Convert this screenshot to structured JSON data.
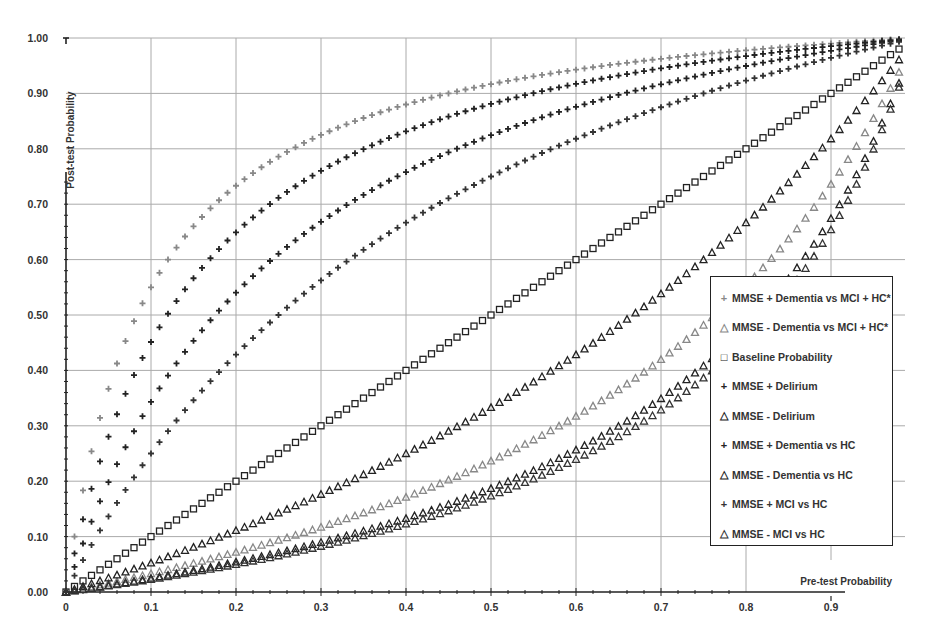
{
  "chart_data": {
    "type": "scatter",
    "title": "",
    "xlabel": "Pre-test Probability",
    "ylabel": "Post-test Probability",
    "xlim": [
      0,
      1.0
    ],
    "ylim": [
      0,
      1.0
    ],
    "x_ticks": [
      "0",
      "0.1",
      "0.2",
      "0.3",
      "0.4",
      "0.5",
      "0.6",
      "0.7",
      "0.8",
      "0.9"
    ],
    "y_ticks": [
      "0.00",
      "0.10",
      "0.20",
      "0.30",
      "0.40",
      "0.50",
      "0.60",
      "0.70",
      "0.80",
      "0.90",
      "1.00"
    ],
    "grid": true,
    "legend_position": "lower right",
    "x_step": 0.01,
    "x_max": 0.98,
    "series": [
      {
        "name": "MMSE + Dementia vs MCI + HC*",
        "marker": "plus",
        "color": "#888888",
        "likelihood_ratio": 11.0
      },
      {
        "name": "MMSE - Dementia vs MCI + HC*",
        "marker": "triangle",
        "color": "#888888",
        "likelihood_ratio": 0.31
      },
      {
        "name": "Baseline Probability",
        "marker": "square",
        "color": "#222222",
        "likelihood_ratio": 1.0
      },
      {
        "name": "MMSE + Delirium",
        "marker": "plus",
        "color": "#222222",
        "likelihood_ratio": 7.4
      },
      {
        "name": "MMSE - Delirium",
        "marker": "triangle",
        "color": "#222222",
        "likelihood_ratio": 0.5
      },
      {
        "name": "MMSE + Dementia vs HC",
        "marker": "plus",
        "color": "#222222",
        "likelihood_ratio": 4.7
      },
      {
        "name": "MMSE - Dementia vs HC",
        "marker": "triangle",
        "color": "#222222",
        "likelihood_ratio": 0.23
      },
      {
        "name": "MMSE + MCI vs HC",
        "marker": "plus",
        "color": "#333333",
        "likelihood_ratio": 3.0
      },
      {
        "name": "MMSE - MCI vs HC",
        "marker": "triangle",
        "color": "#333333",
        "likelihood_ratio": 0.21
      }
    ],
    "sample_values_at_x": {
      "x": [
        0.1,
        0.2,
        0.3,
        0.4,
        0.5,
        0.6,
        0.7,
        0.8,
        0.9
      ],
      "MMSE + Dementia vs MCI + HC*": [
        0.55,
        0.73,
        0.83,
        0.88,
        0.92,
        0.94,
        0.96,
        0.98,
        0.99
      ],
      "MMSE + Delirium": [
        0.45,
        0.65,
        0.76,
        0.83,
        0.88,
        0.92,
        0.95,
        0.97,
        0.99
      ],
      "MMSE + Dementia vs HC": [
        0.34,
        0.54,
        0.67,
        0.76,
        0.82,
        0.88,
        0.92,
        0.95,
        0.98
      ],
      "MMSE + MCI vs HC": [
        0.25,
        0.43,
        0.56,
        0.67,
        0.75,
        0.82,
        0.88,
        0.92,
        0.96
      ],
      "Baseline Probability": [
        0.1,
        0.2,
        0.3,
        0.4,
        0.5,
        0.6,
        0.7,
        0.8,
        0.9
      ],
      "MMSE - Delirium": [
        0.05,
        0.11,
        0.18,
        0.25,
        0.33,
        0.43,
        0.54,
        0.67,
        0.82
      ],
      "MMSE - Dementia vs MCI + HC*": [
        0.03,
        0.07,
        0.12,
        0.17,
        0.24,
        0.32,
        0.42,
        0.55,
        0.74
      ],
      "MMSE - Dementia vs HC": [
        0.02,
        0.05,
        0.09,
        0.13,
        0.19,
        0.26,
        0.35,
        0.48,
        0.67
      ],
      "MMSE - MCI vs HC": [
        0.02,
        0.05,
        0.08,
        0.12,
        0.17,
        0.24,
        0.33,
        0.46,
        0.65
      ]
    }
  },
  "legend": {
    "items": [
      {
        "label": "MMSE + Dementia vs MCI + HC*",
        "symbol": "+",
        "color": "#888888"
      },
      {
        "label": "MMSE - Dementia vs MCI + HC*",
        "symbol": "△",
        "color": "#888888"
      },
      {
        "label": "Baseline Probability",
        "symbol": "□",
        "color": "#222222"
      },
      {
        "label": "MMSE + Delirium",
        "symbol": "+",
        "color": "#222222"
      },
      {
        "label": "MMSE - Delirium",
        "symbol": "△",
        "color": "#222222"
      },
      {
        "label": "MMSE + Dementia vs HC",
        "symbol": "+",
        "color": "#222222"
      },
      {
        "label": "MMSE - Dementia vs HC",
        "symbol": "△",
        "color": "#222222"
      },
      {
        "label": "MMSE + MCI vs HC",
        "symbol": "+",
        "color": "#333333"
      },
      {
        "label": "MMSE - MCI vs HC",
        "symbol": "△",
        "color": "#333333"
      }
    ]
  },
  "axes": {
    "x_label": "Pre-test Probability",
    "y_label": "Post-test Probability"
  }
}
